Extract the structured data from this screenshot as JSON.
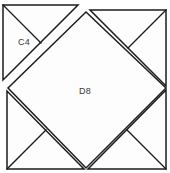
{
  "figure": {
    "canvas": {
      "width": 170,
      "height": 173
    },
    "colors": {
      "background": "#ffffff",
      "fill": "#fdfdfd",
      "stroke": "#1c1c1c",
      "label_text": "#3a3a3a"
    },
    "labels": [
      {
        "id": "c4",
        "text": "C4",
        "x": 24,
        "y": 43
      },
      {
        "id": "d8",
        "text": "D8",
        "x": 85,
        "y": 92
      }
    ],
    "pieces": {
      "outer_square": {
        "name": "outer-square",
        "points": "6,9 166,9 166,170 6,170"
      },
      "center_diamond": {
        "name": "center-diamond-d8",
        "points": "86,12 166,88 86,168 8,88"
      },
      "corner_top_right": {
        "name": "corner-triangle-top-right",
        "points": "90,10 166,10 166,86"
      },
      "corner_bottom_right": {
        "name": "corner-triangle-bottom-right",
        "points": "166,90 166,169 88,169"
      },
      "corner_bottom_left": {
        "name": "corner-triangle-bottom-left",
        "points": "84,169 7,169 7,91"
      },
      "piece_c4": {
        "name": "corner-triangle-top-left-c4",
        "points": "3,5 78,5 3,80"
      }
    },
    "median_lines": [
      {
        "id": "median-top-right",
        "name": "median-top-right",
        "d": "M 166,10 L 128,48"
      },
      {
        "id": "median-bottom-right",
        "name": "median-bottom-right",
        "d": "M 166,169 L 127,130"
      },
      {
        "id": "median-bottom-left",
        "name": "median-bottom-left",
        "d": "M 7,169 L 46,130"
      },
      {
        "id": "median-c4",
        "name": "median-c4-hypotenuse-split",
        "d": "M 3,5 L 41,43"
      }
    ]
  }
}
